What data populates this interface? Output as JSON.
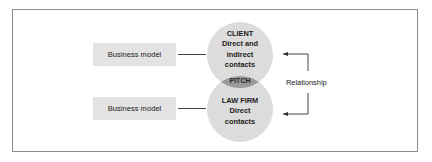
{
  "diagram": {
    "left_boxes": [
      {
        "label": "Business model"
      },
      {
        "label": "Business model"
      }
    ],
    "client_circle": {
      "lines": [
        "CLIENT",
        "Direct and",
        "indirect",
        "contacts"
      ]
    },
    "lawfirm_circle": {
      "lines": [
        "LAW FIRM",
        "Direct",
        "contacts"
      ]
    },
    "intersection_label": "PITCH",
    "relationship_label": "Relationship",
    "colors": {
      "circle": "#dcdcdc",
      "intersection": "#9a9a9a",
      "box": "#e3e3e3",
      "frame": "#8c8c8c"
    }
  }
}
